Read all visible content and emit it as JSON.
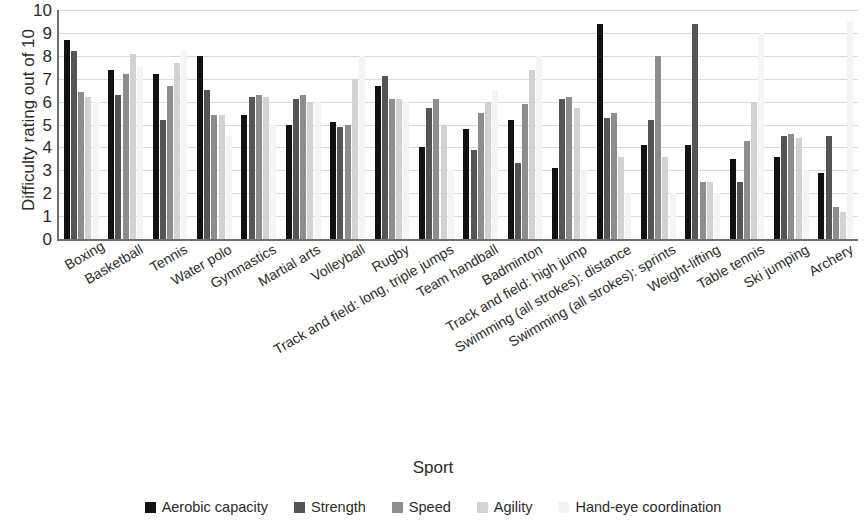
{
  "chart_data": {
    "type": "bar",
    "title": "",
    "xlabel": "Sport",
    "ylabel": "Difficulty rating out of 10",
    "ylim": [
      0,
      10
    ],
    "ytick_step": 1,
    "yticks": [
      0,
      1,
      2,
      3,
      4,
      5,
      6,
      7,
      8,
      9,
      10
    ],
    "grid": true,
    "legend_position": "bottom",
    "orientation": "vertical",
    "grouping": "clustered",
    "categories": [
      "Boxing",
      "Basketball",
      "Tennis",
      "Water polo",
      "Gymnastics",
      "Martial arts",
      "Volleyball",
      "Rugby",
      "Track and field: long, triple jumps",
      "Team handball",
      "Badminton",
      "Track and field: high jump",
      "Swimming (all strokes): distance",
      "Swimming (all strokes): sprints",
      "Weight-lifting",
      "Table tennis",
      "Ski jumping",
      "Archery"
    ],
    "series": [
      {
        "name": "Aerobic capacity",
        "color": "#121212",
        "values": [
          8.7,
          7.4,
          7.2,
          8.0,
          5.4,
          5.0,
          5.1,
          6.7,
          4.0,
          4.8,
          5.2,
          3.1,
          9.4,
          4.1,
          4.1,
          3.5,
          3.6,
          2.9
        ]
      },
      {
        "name": "Strength",
        "color": "#555555",
        "values": [
          8.2,
          6.3,
          5.2,
          6.5,
          6.2,
          6.1,
          4.9,
          7.1,
          5.7,
          3.9,
          3.3,
          6.1,
          5.3,
          5.2,
          9.4,
          2.5,
          4.5,
          4.5
        ]
      },
      {
        "name": "Speed",
        "color": "#8d8d8d",
        "values": [
          6.4,
          7.2,
          6.7,
          5.4,
          6.3,
          6.3,
          5.0,
          6.1,
          6.1,
          5.5,
          5.9,
          6.2,
          5.5,
          8.0,
          2.5,
          4.3,
          4.6,
          1.4
        ]
      },
      {
        "name": "Agility",
        "color": "#d2d2d2",
        "values": [
          6.2,
          8.1,
          7.7,
          5.4,
          6.2,
          6.0,
          7.0,
          6.1,
          5.0,
          6.0,
          7.4,
          5.7,
          3.6,
          3.6,
          2.5,
          6.0,
          4.4,
          1.2
        ]
      },
      {
        "name": "Hand-eye coordination",
        "color": "#f4f4f4",
        "values": [
          6.0,
          7.5,
          8.2,
          4.5,
          5.0,
          6.0,
          8.0,
          6.0,
          3.0,
          6.5,
          8.0,
          3.0,
          2.0,
          2.0,
          2.0,
          9.0,
          3.0,
          9.5
        ]
      }
    ]
  },
  "legend": {
    "items": [
      {
        "label": "Aerobic capacity"
      },
      {
        "label": "Strength"
      },
      {
        "label": "Speed"
      },
      {
        "label": "Agility"
      },
      {
        "label": "Hand-eye coordination"
      }
    ]
  }
}
